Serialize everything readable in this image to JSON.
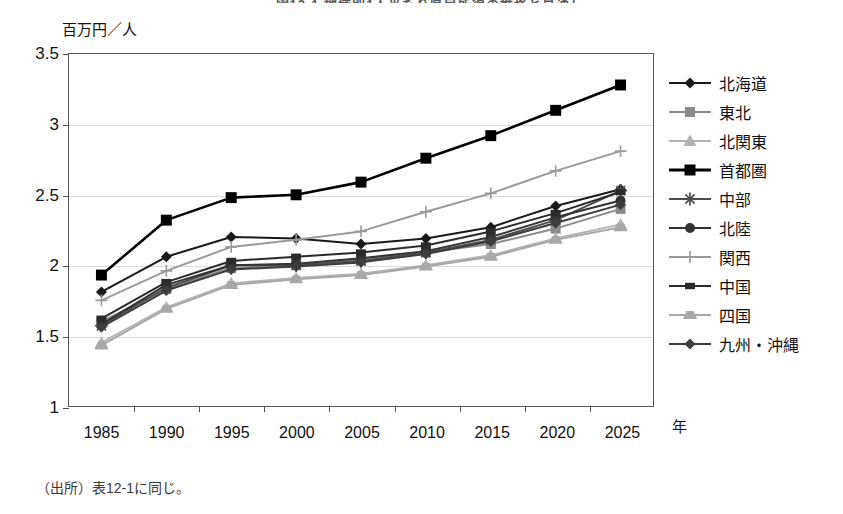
{
  "title": "図12-1 地域別1人当たり県民所得の推移と見通し",
  "footnote": "（出所）表12-1に同じ。",
  "axes": {
    "y_unit": "百万円／人",
    "x_unit": "年",
    "y_ticks": [
      "3.5",
      "3",
      "2.5",
      "2",
      "1.5",
      "1"
    ],
    "x_ticks": [
      "1985",
      "1990",
      "1995",
      "2000",
      "2005",
      "2010",
      "2015",
      "2020",
      "2025"
    ]
  },
  "colors": {
    "hokkaido": "#1a1a1a",
    "tohoku": "#8a8a8a",
    "kitakanto": "#b3b3b3",
    "shutoken": "#000000",
    "chubu": "#4d4d4d",
    "hokuriku": "#333333",
    "kansai": "#9a9a9a",
    "chugoku": "#2b2b2b",
    "shikoku": "#a8a8a8",
    "kyushu_okinawa": "#3d3d3d",
    "grid": "#d9d9d9",
    "frame": "#555555"
  },
  "chart_data": {
    "type": "line",
    "title": "図12-1 地域別1人当たり県民所得の推移と見通し",
    "xlabel": "年",
    "ylabel": "百万円／人",
    "ylim": [
      1,
      3.5
    ],
    "ytick_step": 0.5,
    "grid": true,
    "legend_position": "right",
    "categories": [
      "1985",
      "1990",
      "1995",
      "2000",
      "2005",
      "2010",
      "2015",
      "2020",
      "2025"
    ],
    "series": [
      {
        "name": "北海道",
        "marker": "diamond",
        "values": [
          1.81,
          2.06,
          2.2,
          2.19,
          2.15,
          2.19,
          2.27,
          2.42,
          2.54
        ]
      },
      {
        "name": "東北",
        "marker": "square",
        "values": [
          1.6,
          1.83,
          1.98,
          2.0,
          2.04,
          2.09,
          2.15,
          2.26,
          2.4
        ]
      },
      {
        "name": "北関東",
        "marker": "triangle",
        "values": [
          1.45,
          1.7,
          1.87,
          1.91,
          1.94,
          2.0,
          2.07,
          2.19,
          2.29
        ]
      },
      {
        "name": "首都圏",
        "marker": "filled-square",
        "values": [
          1.93,
          2.32,
          2.48,
          2.5,
          2.59,
          2.76,
          2.92,
          3.1,
          3.28
        ]
      },
      {
        "name": "中部",
        "marker": "star",
        "values": [
          1.57,
          1.84,
          2.0,
          2.0,
          2.03,
          2.09,
          2.18,
          2.32,
          2.53
        ]
      },
      {
        "name": "北陸",
        "marker": "circle",
        "values": [
          1.58,
          1.86,
          2.0,
          2.01,
          2.05,
          2.1,
          2.2,
          2.34,
          2.46
        ]
      },
      {
        "name": "関西",
        "marker": "plus",
        "values": [
          1.75,
          1.96,
          2.13,
          2.18,
          2.24,
          2.38,
          2.51,
          2.67,
          2.81
        ]
      },
      {
        "name": "中国",
        "marker": "small-square",
        "values": [
          1.62,
          1.88,
          2.03,
          2.06,
          2.09,
          2.14,
          2.24,
          2.37,
          2.52
        ]
      },
      {
        "name": "四国",
        "marker": "bar",
        "values": [
          1.43,
          1.69,
          1.86,
          1.9,
          1.93,
          1.99,
          2.06,
          2.18,
          2.27
        ]
      },
      {
        "name": "九州・沖縄",
        "marker": "diamond",
        "values": [
          1.56,
          1.82,
          1.97,
          1.99,
          2.02,
          2.08,
          2.17,
          2.3,
          2.43
        ]
      }
    ]
  },
  "legend": {
    "items": [
      {
        "label": "北海道",
        "marker": "diamond",
        "color": "#1a1a1a"
      },
      {
        "label": "東北",
        "marker": "square",
        "color": "#8a8a8a"
      },
      {
        "label": "北関東",
        "marker": "triangle",
        "color": "#b3b3b3"
      },
      {
        "label": "首都圏",
        "marker": "filled-square",
        "color": "#000000"
      },
      {
        "label": "中部",
        "marker": "star",
        "color": "#4d4d4d"
      },
      {
        "label": "北陸",
        "marker": "circle",
        "color": "#333333"
      },
      {
        "label": "関西",
        "marker": "plus",
        "color": "#9a9a9a"
      },
      {
        "label": "中国",
        "marker": "small-square",
        "color": "#2b2b2b"
      },
      {
        "label": "四国",
        "marker": "bar",
        "color": "#a8a8a8"
      },
      {
        "label": "九州・沖縄",
        "marker": "diamond",
        "color": "#3d3d3d"
      }
    ]
  }
}
